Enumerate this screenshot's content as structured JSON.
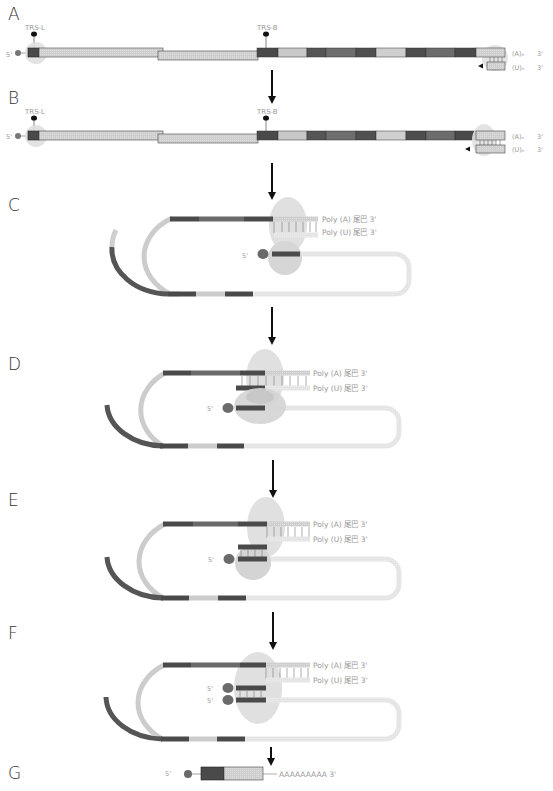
{
  "colors": {
    "dark": "#4a4a4a",
    "mid": "#6e6e6e",
    "light": "#cccccc",
    "pale": "#e2e2e2",
    "halo": "#d9d9d9",
    "text": "#9a9a9a",
    "arrow": "#111111"
  },
  "panels": {
    "A": {
      "label": "A",
      "trs_l": "TRS-L",
      "trs_b": "TRS-B",
      "five_prime": "5'",
      "poly_a": "(A)ₙ",
      "poly_u": "(U)ₙ",
      "three_prime_top": "3'",
      "three_prime_bottom": "3'"
    },
    "B": {
      "label": "B",
      "trs_l": "TRS-L",
      "trs_b": "TRS-B",
      "five_prime": "5'",
      "poly_a": "(A)ₙ",
      "poly_u": "(U)ₙ",
      "three_prime_top": "3'",
      "three_prime_bottom": "3'"
    },
    "C": {
      "label": "C",
      "poly_a_tail": "Poly (A) 尾巴 3'",
      "poly_u_tail": "Poly (U) 尾巴 3'",
      "five_prime": "5'"
    },
    "D": {
      "label": "D",
      "poly_a_tail": "Poly (A) 尾巴 3'",
      "poly_u_tail": "Poly (U) 尾巴 3'",
      "five_prime": "5'"
    },
    "E": {
      "label": "E",
      "poly_a_tail": "Poly (A) 尾巴 3'",
      "poly_u_tail": "Poly (U) 尾巴 3'",
      "five_prime": "5'"
    },
    "F": {
      "label": "F",
      "poly_a_tail": "Poly (A) 尾巴 3'",
      "poly_u_tail": "Poly (U) 尾巴 3'",
      "five_prime_1": "5'",
      "five_prime_2": "5'"
    },
    "G": {
      "label": "G",
      "five_prime": "5'",
      "poly_a_tail": "AAAAAAAAA 3'"
    }
  }
}
